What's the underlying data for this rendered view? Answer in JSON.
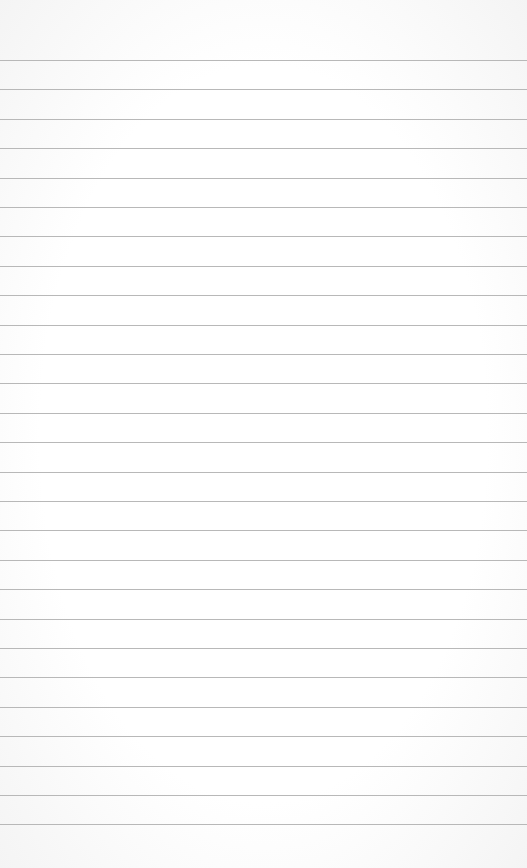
{
  "paper": {
    "background": "#fdfdfd",
    "rule_color": "#b8b8b8",
    "rule_count": 27,
    "first_rule_y": 60,
    "rule_spacing": 29.4
  }
}
